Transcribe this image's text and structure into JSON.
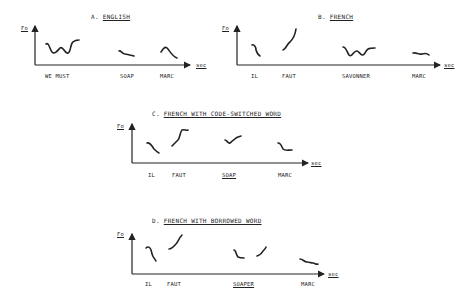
{
  "panels": [
    {
      "id": "A",
      "prefix": "A.",
      "title": "ENGLISH",
      "y_axis_label": "Fo",
      "x_axis_label": "sec",
      "words": [
        "WE MUST",
        "SOAP",
        "MARC"
      ],
      "underlined_word": null
    },
    {
      "id": "B",
      "prefix": "B.",
      "title": "FRENCH",
      "y_axis_label": "Fo",
      "x_axis_label": "sec",
      "words": [
        "IL",
        "FAUT",
        "SAVONNER",
        "MARC"
      ],
      "underlined_word": null
    },
    {
      "id": "C",
      "prefix": "C.",
      "title": "FRENCH WITH CODE-SWITCHED WORD",
      "y_axis_label": "Fo",
      "x_axis_label": "sec",
      "words": [
        "IL",
        "FAUT",
        "SOAP",
        "MARC"
      ],
      "underlined_word": "SOAP"
    },
    {
      "id": "D",
      "prefix": "D.",
      "title": "FRENCH WITH BORROWED WORD",
      "y_axis_label": "Fo",
      "x_axis_label": "sec",
      "words": [
        "IL",
        "FAUT",
        "SOAPER",
        "MARC"
      ],
      "underlined_word": "SOAPER"
    }
  ]
}
